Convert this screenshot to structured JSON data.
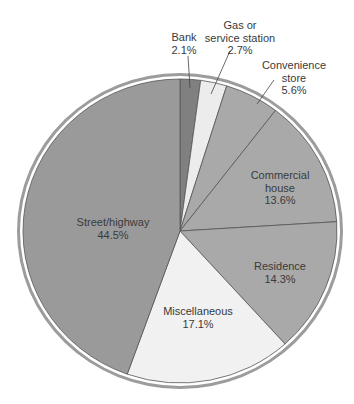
{
  "chart_data": {
    "type": "pie",
    "title": "",
    "start_angle_deg": 0,
    "direction": "clockwise",
    "slices": [
      {
        "label": "Bank",
        "value": 2.1,
        "display": "2.1%",
        "color": "#808080"
      },
      {
        "label": "Gas or service station",
        "value": 2.7,
        "display": "2.7%",
        "color": "#ececec"
      },
      {
        "label": "Convenience store",
        "value": 5.6,
        "display": "5.6%",
        "color": "#a9a9a9"
      },
      {
        "label": "Commercial house",
        "value": 13.6,
        "display": "13.6%",
        "color": "#a9a9a9"
      },
      {
        "label": "Residence",
        "value": 14.3,
        "display": "14.3%",
        "color": "#a9a9a9"
      },
      {
        "label": "Miscellaneous",
        "value": 17.1,
        "display": "17.1%",
        "color": "#f1f1f1"
      },
      {
        "label": "Street/highway",
        "value": 44.5,
        "display": "44.5%",
        "color": "#9a9a9a"
      }
    ]
  },
  "labels": {
    "bank": {
      "line1": "Bank",
      "value": "2.1%"
    },
    "gas": {
      "line1": "Gas or",
      "line2": "service station",
      "value": "2.7%"
    },
    "convenience": {
      "line1": "Convenience",
      "line2": "store",
      "value": "5.6%"
    },
    "commercial": {
      "line1": "Commercial",
      "line2": "house",
      "value": "13.6%"
    },
    "residence": {
      "line1": "Residence",
      "value": "14.3%"
    },
    "misc": {
      "line1": "Miscellaneous",
      "value": "17.1%"
    },
    "street": {
      "line1": "Street/highway",
      "value": "44.5%"
    }
  },
  "colors": {
    "ring": "#9c9c9c",
    "slice_border": "#555555",
    "text": "#3a3a3a",
    "background": "#ffffff"
  }
}
